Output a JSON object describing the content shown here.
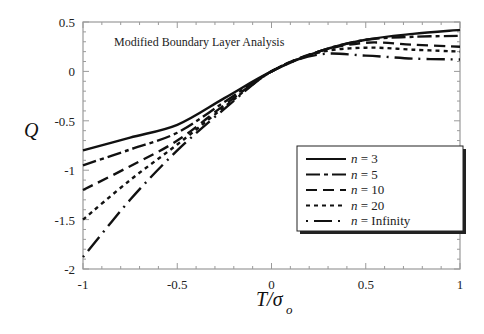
{
  "chart_data": {
    "type": "line",
    "title": "",
    "annotation": "Modified Boundary Layer Analysis",
    "xlabel": "T/σo",
    "xlabel_main": "T/σ",
    "xlabel_sub": "o",
    "ylabel": "Q",
    "xlim": [
      -1,
      1
    ],
    "ylim": [
      -2,
      0.5
    ],
    "xticks": [
      -1,
      -0.5,
      0,
      0.5,
      1
    ],
    "xtick_labels": [
      "-1",
      "-0.5",
      "0",
      "0.5",
      "1"
    ],
    "yticks": [
      -2,
      -1.5,
      -1,
      -0.5,
      0,
      0.5
    ],
    "ytick_labels": [
      "-2",
      "-1.5",
      "-1",
      "-0.5",
      "0",
      "0.5"
    ],
    "grid": false,
    "legend_position": "lower right (inside)",
    "x": [
      -1,
      -0.75,
      -0.5,
      -0.25,
      0,
      0.25,
      0.5,
      0.75,
      1
    ],
    "series": [
      {
        "name": "n = 3",
        "style": "solid",
        "values": [
          -0.8,
          -0.67,
          -0.54,
          -0.27,
          0.0,
          0.2,
          0.32,
          0.38,
          0.42
        ]
      },
      {
        "name": "n = 5",
        "style": "dash-dot",
        "values": [
          -0.95,
          -0.79,
          -0.62,
          -0.31,
          0.0,
          0.2,
          0.32,
          0.35,
          0.36
        ]
      },
      {
        "name": "n = 10",
        "style": "long-dash",
        "values": [
          -1.2,
          -0.96,
          -0.7,
          -0.34,
          0.0,
          0.2,
          0.29,
          0.27,
          0.25
        ]
      },
      {
        "name": "n = 20",
        "style": "short-dash",
        "values": [
          -1.5,
          -1.1,
          -0.74,
          -0.36,
          0.0,
          0.19,
          0.24,
          0.22,
          0.2
        ]
      },
      {
        "name": "n = Infinity",
        "style": "dot-long-dash",
        "values": [
          -1.88,
          -1.3,
          -0.8,
          -0.38,
          0.0,
          0.17,
          0.16,
          0.13,
          0.12
        ]
      }
    ],
    "legend": [
      {
        "label": "n = 3",
        "n": "n",
        "eq": " = 3"
      },
      {
        "label": "n = 5",
        "n": "n",
        "eq": " = 5"
      },
      {
        "label": "n = 10",
        "n": "n",
        "eq": " = 10"
      },
      {
        "label": "n = 20",
        "n": "n",
        "eq": " = 20"
      },
      {
        "label": "n = Infinity",
        "n": "n",
        "eq": " = Infinity"
      }
    ],
    "colors": {
      "line": "#111111",
      "axis": "#9a9a9a",
      "background": "#ffffff"
    }
  }
}
